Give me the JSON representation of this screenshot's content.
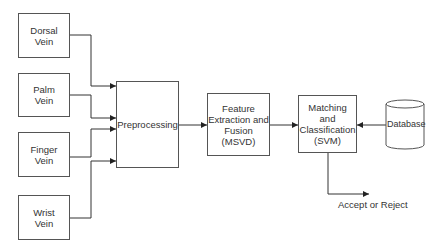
{
  "diagram": {
    "inputs": [
      {
        "id": "dorsal",
        "label": "Dorsal\nVein"
      },
      {
        "id": "palm",
        "label": "Palm\nVein"
      },
      {
        "id": "finger",
        "label": "Finger\nVein"
      },
      {
        "id": "wrist",
        "label": "Wrist\nVein"
      }
    ],
    "preprocessing": {
      "label": "Preprocessing"
    },
    "feature": {
      "label": "Feature\nExtraction and\nFusion\n(MSVD)"
    },
    "matching": {
      "label": "Matching\nand\nClassification\n(SVM)"
    },
    "database": {
      "label": "Database"
    },
    "output": {
      "label": "Accept or Reject"
    },
    "edges": [
      {
        "from": "Dorsal Vein",
        "to": "Preprocessing"
      },
      {
        "from": "Palm Vein",
        "to": "Preprocessing"
      },
      {
        "from": "Finger Vein",
        "to": "Preprocessing"
      },
      {
        "from": "Wrist Vein",
        "to": "Preprocessing"
      },
      {
        "from": "Preprocessing",
        "to": "Feature Extraction and Fusion (MSVD)"
      },
      {
        "from": "Feature Extraction and Fusion (MSVD)",
        "to": "Matching and Classification (SVM)"
      },
      {
        "from": "Database",
        "to": "Matching and Classification (SVM)"
      },
      {
        "from": "Matching and Classification (SVM)",
        "to": "Accept or Reject"
      }
    ]
  }
}
